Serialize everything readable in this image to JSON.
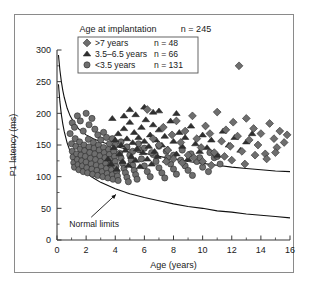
{
  "figure": {
    "header_label": "Age at implantation",
    "header_n": "n = 245",
    "annotation": "Normal limits"
  },
  "legend": {
    "rows": [
      {
        "marker": "diamond-marker",
        "label": ">7 years",
        "n": "n = 48"
      },
      {
        "marker": "triangle-marker",
        "label": "3.5–6.5 years",
        "n": "n = 66"
      },
      {
        "marker": "circle-marker",
        "label": "<3.5 years",
        "n": "n = 131"
      }
    ]
  },
  "colors": {
    "marker_fill": "#6e6e6e",
    "marker_stroke": "#2b2b2b",
    "curve": "#111111",
    "axis": "#3a3a3a",
    "frame": "#8a8a8a",
    "background": "#ffffff"
  },
  "chart_data": {
    "type": "scatter",
    "title": "",
    "xlabel": "Age (years)",
    "ylabel": "P1 latency (ms)",
    "xlim": [
      0,
      16
    ],
    "ylim": [
      0,
      300
    ],
    "xticks": [
      0,
      2,
      4,
      6,
      8,
      10,
      12,
      14,
      16
    ],
    "yticks": [
      0,
      50,
      100,
      150,
      200,
      250,
      300
    ],
    "xminor_step": 1,
    "yminor_step": 25,
    "grid": false,
    "legend_position": "top-center",
    "series": [
      {
        "name": "<3.5 years",
        "marker": "circle",
        "count": 131,
        "points": [
          [
            0.9,
            168
          ],
          [
            1.0,
            152
          ],
          [
            1.05,
            140
          ],
          [
            1.1,
            131
          ],
          [
            1.15,
            122
          ],
          [
            1.2,
            115
          ],
          [
            1.25,
            160
          ],
          [
            1.3,
            148
          ],
          [
            1.35,
            136
          ],
          [
            1.4,
            127
          ],
          [
            1.45,
            119
          ],
          [
            1.5,
            111
          ],
          [
            1.55,
            155
          ],
          [
            1.6,
            144
          ],
          [
            1.65,
            134
          ],
          [
            1.7,
            125
          ],
          [
            1.75,
            117
          ],
          [
            1.8,
            108
          ],
          [
            1.85,
            150
          ],
          [
            1.9,
            141
          ],
          [
            1.95,
            132
          ],
          [
            2.0,
            123
          ],
          [
            2.05,
            114
          ],
          [
            2.1,
            106
          ],
          [
            2.15,
            159
          ],
          [
            2.2,
            147
          ],
          [
            2.25,
            138
          ],
          [
            2.3,
            129
          ],
          [
            2.35,
            120
          ],
          [
            2.4,
            112
          ],
          [
            2.45,
            104
          ],
          [
            2.5,
            154
          ],
          [
            2.55,
            145
          ],
          [
            2.6,
            136
          ],
          [
            2.65,
            127
          ],
          [
            2.7,
            118
          ],
          [
            2.75,
            110
          ],
          [
            2.8,
            102
          ],
          [
            2.85,
            150
          ],
          [
            2.9,
            142
          ],
          [
            2.95,
            133
          ],
          [
            3.0,
            124
          ],
          [
            3.05,
            116
          ],
          [
            3.1,
            108
          ],
          [
            3.15,
            100
          ],
          [
            3.2,
            146
          ],
          [
            3.25,
            138
          ],
          [
            3.3,
            130
          ],
          [
            3.35,
            121
          ],
          [
            3.4,
            113
          ],
          [
            3.45,
            105
          ],
          [
            3.5,
            98
          ],
          [
            3.55,
            143
          ],
          [
            3.6,
            135
          ],
          [
            3.65,
            127
          ],
          [
            3.7,
            119
          ],
          [
            3.75,
            111
          ],
          [
            3.8,
            103
          ],
          [
            3.85,
            96
          ],
          [
            3.9,
            140
          ],
          [
            3.95,
            132
          ],
          [
            4.0,
            124
          ],
          [
            4.05,
            116
          ],
          [
            4.1,
            108
          ],
          [
            4.15,
            101
          ],
          [
            4.2,
            94
          ],
          [
            4.3,
            137
          ],
          [
            4.4,
            129
          ],
          [
            4.5,
            121
          ],
          [
            4.6,
            113
          ],
          [
            4.7,
            106
          ],
          [
            4.8,
            99
          ],
          [
            4.9,
            92
          ],
          [
            5.0,
            134
          ],
          [
            5.1,
            126
          ],
          [
            5.2,
            118
          ],
          [
            5.3,
            110
          ],
          [
            5.4,
            103
          ],
          [
            5.5,
            96
          ],
          [
            5.6,
            143
          ],
          [
            5.8,
            128
          ],
          [
            6.0,
            117
          ],
          [
            6.2,
            108
          ],
          [
            6.4,
            100
          ],
          [
            6.6,
            135
          ],
          [
            6.8,
            124
          ],
          [
            7.0,
            114
          ],
          [
            7.2,
            106
          ],
          [
            7.4,
            98
          ],
          [
            7.6,
            130
          ],
          [
            7.8,
            120
          ],
          [
            8.0,
            112
          ],
          [
            8.2,
            104
          ],
          [
            8.5,
            126
          ],
          [
            8.8,
            117
          ],
          [
            9.0,
            110
          ],
          [
            9.3,
            102
          ],
          [
            9.6,
            124
          ],
          [
            10.0,
            115
          ],
          [
            10.4,
            108
          ],
          [
            10.8,
            130
          ],
          [
            11.2,
            120
          ],
          [
            1.05,
            185
          ],
          [
            1.2,
            178
          ],
          [
            1.4,
            196
          ],
          [
            1.6,
            188
          ],
          [
            1.8,
            172
          ],
          [
            2.0,
            200
          ],
          [
            2.2,
            182
          ],
          [
            2.4,
            192
          ],
          [
            2.6,
            175
          ],
          [
            2.8,
            166
          ],
          [
            3.0,
            158
          ],
          [
            3.2,
            170
          ],
          [
            3.4,
            162
          ],
          [
            3.6,
            152
          ],
          [
            3.8,
            160
          ],
          [
            4.0,
            150
          ],
          [
            4.4,
            155
          ],
          [
            4.8,
            147
          ],
          [
            5.2,
            140
          ],
          [
            5.6,
            152
          ],
          [
            6.0,
            145
          ],
          [
            6.5,
            138
          ],
          [
            7.0,
            148
          ],
          [
            7.5,
            140
          ],
          [
            8.0,
            134
          ],
          [
            8.6,
            142
          ],
          [
            9.2,
            136
          ],
          [
            9.8,
            130
          ],
          [
            10.5,
            138
          ],
          [
            11.0,
            132
          ]
        ]
      },
      {
        "name": "3.5–6.5 years",
        "marker": "triangle",
        "count": 66,
        "points": [
          [
            3.5,
            128
          ],
          [
            3.7,
            120
          ],
          [
            3.9,
            146
          ],
          [
            4.0,
            158
          ],
          [
            4.1,
            112
          ],
          [
            4.2,
            168
          ],
          [
            4.3,
            136
          ],
          [
            4.4,
            150
          ],
          [
            4.5,
            124
          ],
          [
            4.6,
            176
          ],
          [
            4.7,
            142
          ],
          [
            4.8,
            160
          ],
          [
            4.9,
            118
          ],
          [
            5.0,
            186
          ],
          [
            5.1,
            132
          ],
          [
            5.2,
            154
          ],
          [
            5.3,
            170
          ],
          [
            5.4,
            126
          ],
          [
            5.5,
            144
          ],
          [
            5.6,
            162
          ],
          [
            5.7,
            116
          ],
          [
            5.8,
            178
          ],
          [
            5.9,
            138
          ],
          [
            6.0,
            156
          ],
          [
            6.1,
            190
          ],
          [
            6.2,
            128
          ],
          [
            6.3,
            148
          ],
          [
            6.4,
            166
          ],
          [
            6.5,
            120
          ],
          [
            6.6,
            182
          ],
          [
            6.7,
            140
          ],
          [
            6.8,
            158
          ],
          [
            6.9,
            132
          ],
          [
            7.0,
            174
          ],
          [
            7.2,
            150
          ],
          [
            7.4,
            164
          ],
          [
            7.5,
            126
          ],
          [
            7.6,
            144
          ],
          [
            7.8,
            188
          ],
          [
            8.0,
            156
          ],
          [
            8.2,
            136
          ],
          [
            8.4,
            170
          ],
          [
            8.6,
            148
          ],
          [
            8.8,
            162
          ],
          [
            9.0,
            128
          ],
          [
            9.2,
            180
          ],
          [
            9.5,
            152
          ],
          [
            9.8,
            140
          ],
          [
            10.0,
            166
          ],
          [
            10.3,
            146
          ],
          [
            10.6,
            158
          ],
          [
            11.0,
            134
          ],
          [
            11.4,
            172
          ],
          [
            11.8,
            150
          ],
          [
            12.2,
            162
          ],
          [
            12.6,
            142
          ],
          [
            13.0,
            155
          ],
          [
            13.4,
            168
          ],
          [
            5.0,
            206
          ],
          [
            5.4,
            198
          ],
          [
            6.0,
            210
          ],
          [
            6.6,
            202
          ],
          [
            4.6,
            196
          ],
          [
            7.0,
            204
          ],
          [
            3.8,
            192
          ],
          [
            8.2,
            200
          ]
        ]
      },
      {
        "name": ">7 years",
        "marker": "diamond",
        "count": 48,
        "points": [
          [
            6.2,
            206
          ],
          [
            6.6,
            160
          ],
          [
            7.0,
            150
          ],
          [
            7.3,
            178
          ],
          [
            7.6,
            142
          ],
          [
            7.9,
            166
          ],
          [
            8.2,
            188
          ],
          [
            8.5,
            154
          ],
          [
            8.8,
            172
          ],
          [
            9.0,
            134
          ],
          [
            9.3,
            196
          ],
          [
            9.6,
            160
          ],
          [
            9.9,
            146
          ],
          [
            10.2,
            180
          ],
          [
            10.5,
            168
          ],
          [
            10.8,
            138
          ],
          [
            11.0,
            202
          ],
          [
            11.3,
            156
          ],
          [
            11.6,
            174
          ],
          [
            11.9,
            148
          ],
          [
            12.1,
            186
          ],
          [
            12.4,
            164
          ],
          [
            12.5,
            275
          ],
          [
            12.7,
            140
          ],
          [
            13.0,
            192
          ],
          [
            13.2,
            158
          ],
          [
            13.5,
            176
          ],
          [
            13.8,
            150
          ],
          [
            14.0,
            168
          ],
          [
            14.3,
            136
          ],
          [
            14.6,
            184
          ],
          [
            14.9,
            160
          ],
          [
            15.1,
            146
          ],
          [
            15.3,
            172
          ],
          [
            15.6,
            154
          ],
          [
            15.8,
            166
          ],
          [
            8.0,
            128
          ],
          [
            8.6,
            122
          ],
          [
            9.4,
            130
          ],
          [
            10.0,
            124
          ],
          [
            11.5,
            132
          ],
          [
            12.0,
            126
          ],
          [
            13.6,
            134
          ],
          [
            14.4,
            128
          ],
          [
            15.0,
            138
          ],
          [
            12.9,
            120
          ],
          [
            10.6,
            118
          ],
          [
            7.5,
            124
          ]
        ]
      }
    ],
    "reference_curves": [
      {
        "name": "upper normal limit",
        "points": [
          [
            0.1,
            292
          ],
          [
            0.2,
            268
          ],
          [
            0.3,
            250
          ],
          [
            0.4,
            236
          ],
          [
            0.5,
            225
          ],
          [
            0.7,
            208
          ],
          [
            0.9,
            196
          ],
          [
            1.2,
            184
          ],
          [
            1.5,
            175
          ],
          [
            2.0,
            166
          ],
          [
            2.5,
            160
          ],
          [
            3.0,
            155
          ],
          [
            4.0,
            148
          ],
          [
            5.0,
            142
          ],
          [
            6.0,
            137
          ],
          [
            7.0,
            132
          ],
          [
            8.0,
            128
          ],
          [
            9.0,
            124
          ],
          [
            10.0,
            121
          ],
          [
            11.0,
            118
          ],
          [
            12.0,
            115
          ],
          [
            13.0,
            113
          ],
          [
            14.0,
            111
          ],
          [
            15.0,
            109
          ],
          [
            16.0,
            108
          ]
        ]
      },
      {
        "name": "lower normal limit",
        "points": [
          [
            0.1,
            246
          ],
          [
            0.2,
            218
          ],
          [
            0.3,
            198
          ],
          [
            0.4,
            183
          ],
          [
            0.5,
            171
          ],
          [
            0.7,
            153
          ],
          [
            0.9,
            140
          ],
          [
            1.2,
            127
          ],
          [
            1.5,
            117
          ],
          [
            2.0,
            106
          ],
          [
            2.5,
            98
          ],
          [
            3.0,
            91
          ],
          [
            4.0,
            81
          ],
          [
            5.0,
            73
          ],
          [
            6.0,
            67
          ],
          [
            7.0,
            62
          ],
          [
            8.0,
            57
          ],
          [
            9.0,
            53
          ],
          [
            10.0,
            50
          ],
          [
            11.0,
            46
          ],
          [
            12.0,
            44
          ],
          [
            13.0,
            41
          ],
          [
            14.0,
            39
          ],
          [
            15.0,
            37
          ],
          [
            16.0,
            35
          ]
        ]
      }
    ]
  }
}
